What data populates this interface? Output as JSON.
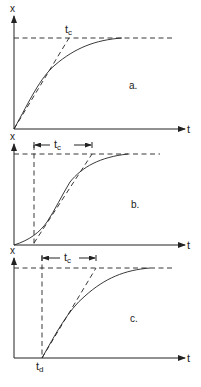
{
  "panels": [
    {
      "id": "a",
      "label": "a.",
      "y_axis": "x",
      "x_axis": "t",
      "tc_label": "t",
      "tc_sub": "c",
      "description": "First-order response: tangent at origin reaches final value at t_c"
    },
    {
      "id": "b",
      "label": "b.",
      "y_axis": "x",
      "x_axis": "t",
      "tc_label": "t",
      "tc_sub": "c",
      "description": "S-shaped response: tangent at inflection point; t_c measured between intercepts"
    },
    {
      "id": "c",
      "label": "c.",
      "y_axis": "x",
      "x_axis": "t",
      "tc_label": "t",
      "tc_sub": "c",
      "td_label": "t",
      "td_sub": "d",
      "description": "First-order response with dead time t_d"
    }
  ],
  "colors": {
    "line": "#222222",
    "background": "#ffffff"
  }
}
